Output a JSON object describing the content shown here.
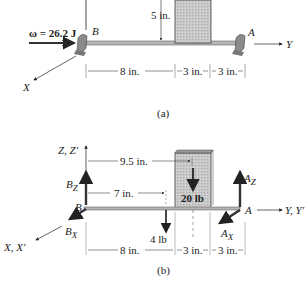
{
  "figure_a": {
    "caption": "(a)",
    "omega_label": "ω = 26.2 J",
    "point_b": "B",
    "point_a": "A",
    "axis_y": "Y",
    "axis_x": "X",
    "dim_height": "5 in.",
    "dims": [
      "8 in.",
      "3 in.",
      "3 in."
    ]
  },
  "figure_b": {
    "caption": "(b)",
    "axis_z": "Z, Z′",
    "axis_y": "Y, Y′",
    "axis_x": "X, X′",
    "point_b": "B",
    "point_a": "A",
    "force_bz": {
      "main": "B",
      "sub": "Z"
    },
    "force_bx": {
      "main": "B",
      "sub": "X"
    },
    "force_az": {
      "main": "A",
      "sub": "Z"
    },
    "force_ax": {
      "main": "A",
      "sub": "X"
    },
    "dim_9_5": "9.5 in.",
    "dim_7": "7 in.",
    "load_20": "20 lb",
    "load_4": "4 lb",
    "dims": [
      "8 in.",
      "3 in.",
      "3 in."
    ]
  },
  "colors": {
    "box_fill": "#c8c8c8",
    "ink": "#222222",
    "shaft": "#9a9a9a"
  }
}
